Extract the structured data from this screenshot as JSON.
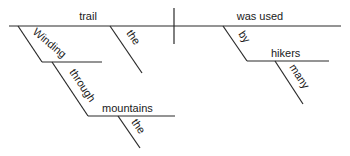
{
  "diagram": {
    "type": "sentence-diagram",
    "words": {
      "subject": "trail",
      "verb": "was used",
      "subject_modifier_article": "the",
      "subject_modifier_participle": "Winding",
      "preposition_1": "through",
      "object_1": "mountains",
      "object_1_article": "the",
      "preposition_2": "by",
      "object_2": "hikers",
      "object_2_modifier": "many"
    }
  }
}
